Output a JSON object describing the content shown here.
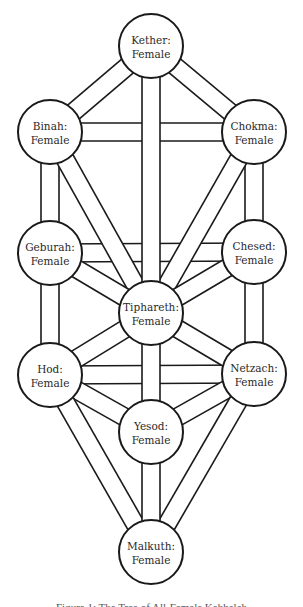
{
  "diagram": {
    "type": "tree-of-life",
    "colors": {
      "stroke": "#1a1a1a",
      "fill": "#ffffff",
      "text": "#2a2a2a"
    },
    "nodes": [
      {
        "id": "kether",
        "name": "Kether:",
        "value": "Female"
      },
      {
        "id": "binah",
        "name": "Binah:",
        "value": "Female"
      },
      {
        "id": "chokma",
        "name": "Chokma:",
        "value": "Female"
      },
      {
        "id": "geburah",
        "name": "Geburah:",
        "value": "Female"
      },
      {
        "id": "chesed",
        "name": "Chesed:",
        "value": "Female"
      },
      {
        "id": "tiphareth",
        "name": "Tiphareth:",
        "value": "Female"
      },
      {
        "id": "hod",
        "name": "Hod:",
        "value": "Female"
      },
      {
        "id": "netzach",
        "name": "Netzach:",
        "value": "Female"
      },
      {
        "id": "yesod",
        "name": "Yesod:",
        "value": "Female"
      },
      {
        "id": "malkuth",
        "name": "Malkuth:",
        "value": "Female"
      }
    ],
    "paths": [
      [
        "binah",
        "chokma"
      ],
      [
        "geburah",
        "chesed"
      ],
      [
        "hod",
        "netzach"
      ],
      [
        "kether",
        "binah"
      ],
      [
        "kether",
        "chokma"
      ],
      [
        "binah",
        "geburah"
      ],
      [
        "chokma",
        "chesed"
      ],
      [
        "geburah",
        "hod"
      ],
      [
        "chesed",
        "netzach"
      ],
      [
        "binah",
        "tiphareth"
      ],
      [
        "chokma",
        "tiphareth"
      ],
      [
        "geburah",
        "tiphareth"
      ],
      [
        "chesed",
        "tiphareth"
      ],
      [
        "hod",
        "tiphareth"
      ],
      [
        "netzach",
        "tiphareth"
      ],
      [
        "kether",
        "tiphareth"
      ],
      [
        "tiphareth",
        "yesod"
      ],
      [
        "hod",
        "yesod"
      ],
      [
        "netzach",
        "yesod"
      ],
      [
        "hod",
        "malkuth"
      ],
      [
        "netzach",
        "malkuth"
      ],
      [
        "yesod",
        "malkuth"
      ]
    ]
  },
  "caption": "Figure 1: The Tree of All-Female Kabbalah"
}
